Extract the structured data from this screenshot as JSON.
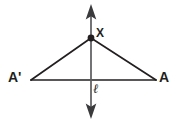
{
  "figure": {
    "background_color": "#ffffff",
    "stroke_color": "#231f20",
    "labels": {
      "apex_point": "X",
      "left_vertex": "A'",
      "right_vertex": "A",
      "line": "ℓ"
    },
    "elements": {
      "vertical_line_name": "line-l-double-arrow",
      "apex_dot_name": "point-x-dot",
      "segment_left_name": "segment-x-to-a-prime",
      "segment_right_name": "segment-x-to-a",
      "base_segment_name": "segment-a-prime-to-a"
    },
    "geometry": {
      "apex": [
        91,
        38
      ],
      "left_vertex": [
        31,
        80
      ],
      "right_vertex": [
        156,
        80
      ],
      "line_top": [
        91,
        5
      ],
      "line_bottom": [
        91,
        118
      ],
      "base_y": 80,
      "dot_radius": 3.2,
      "stroke_width": 1.6
    }
  }
}
